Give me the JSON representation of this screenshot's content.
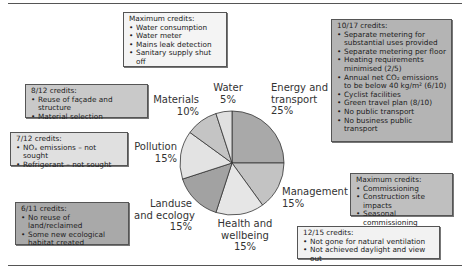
{
  "chart_data": {
    "type": "pie",
    "title": "",
    "slices": [
      {
        "label": "Energy and transport",
        "value": 25,
        "color": "#a9a9a9"
      },
      {
        "label": "Management",
        "value": 15,
        "color": "#c3c3c3"
      },
      {
        "label": "Health and wellbeing",
        "value": 15,
        "color": "#e6e6e6"
      },
      {
        "label": "Landuse and ecology",
        "value": 15,
        "color": "#a2a2a2"
      },
      {
        "label": "Pollution",
        "value": 15,
        "color": "#e3e3e3"
      },
      {
        "label": "Materials",
        "value": 10,
        "color": "#c4c4c4"
      },
      {
        "label": "Water",
        "value": 5,
        "color": "#e0e0e0"
      }
    ],
    "labels": {
      "water": {
        "line1": "Water",
        "line2": "5%"
      },
      "energy": {
        "line1": "Energy and",
        "line2": "transport",
        "line3": "25%"
      },
      "management": {
        "line1": "Management",
        "line2": "15%"
      },
      "health": {
        "line1": "Health and",
        "line2": "wellbeing",
        "line3": "15%"
      },
      "landuse": {
        "line1": "Landuse",
        "line2": "and ecology",
        "line3": "15%"
      },
      "pollution": {
        "line1": "Pollution",
        "line2": "15%"
      },
      "materials": {
        "line1": "Materials",
        "line2": "10%"
      }
    }
  },
  "callouts": {
    "water": {
      "heading": "Maximum credits:",
      "items": [
        "Water consumption",
        "Water meter",
        "Mains leak detection",
        "Sanitary supply shut off"
      ],
      "fill": "#f4f4f4"
    },
    "energy": {
      "heading": "10/17 credits:",
      "items": [
        "Separate metering for substantial uses provided",
        "Separate metering per floor",
        "Heating requirements minimised (2/5)",
        "Annual net CO₂ emissions to be below 40 kg/m² (6/10)",
        "Cyclist facilities",
        "Green travel plan (8/10)",
        "No public transport",
        "No business public transport"
      ],
      "fill": "#b4b4b4"
    },
    "materials": {
      "heading": "8/12 credits:",
      "items": [
        "Reuse of façade and structure",
        "Material selection"
      ],
      "fill": "#c9c9c9"
    },
    "pollution": {
      "heading": "7/12 credits:",
      "items": [
        "NOₓ emissions – not sought",
        "Refrigerant – not sought"
      ],
      "fill": "#e0e0e0"
    },
    "landuse": {
      "heading": "6/11 credits:",
      "items": [
        "No reuse of land/reclaimed",
        "Some new ecological habitat created"
      ],
      "fill": "#a9a9a9"
    },
    "management": {
      "heading": "Maximum credits:",
      "items": [
        "Commissioning",
        "Construction site impacts",
        "Seasonal commissioning"
      ],
      "fill": "#bfbfbf"
    },
    "health": {
      "heading": "12/15 credits:",
      "items": [
        "Not gone for natural ventilation",
        "Not achieved daylight and view out"
      ],
      "fill": "#f2f2f2"
    }
  }
}
